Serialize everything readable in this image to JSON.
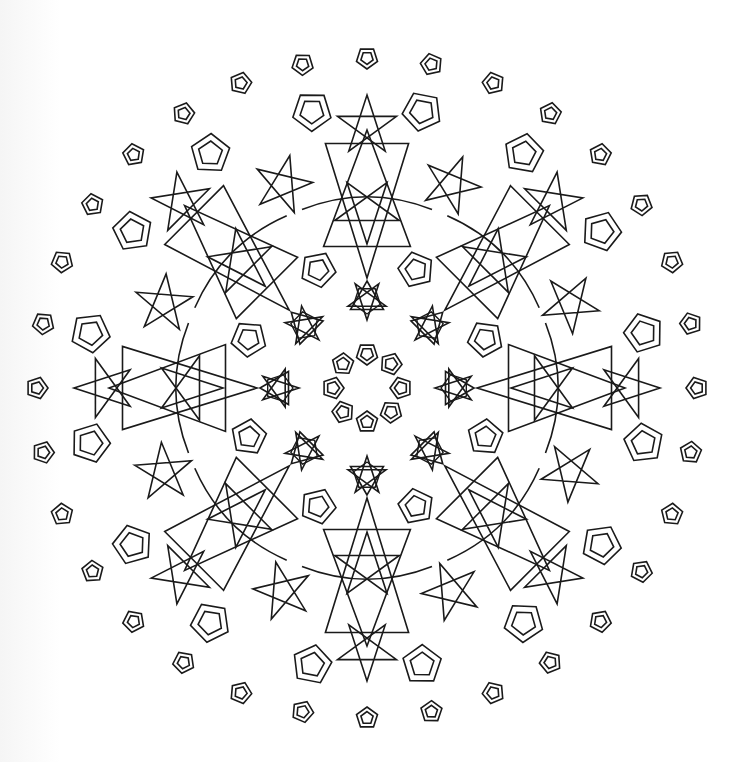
{
  "page": {
    "kind": "mandala-coloring-page",
    "background": "#ffffff",
    "line_color": "#1a1a1a"
  },
  "mandala": {
    "center": [
      367,
      388
    ],
    "symmetry": 8,
    "rings": [
      {
        "name": "inner-pentagon-ring",
        "shape": "double-pentagon",
        "count": 8,
        "radius": 34,
        "size": 11,
        "inner_ratio": 0.6,
        "angle_offset": 0
      },
      {
        "name": "inner-star-cluster-ring",
        "shape": "star-triangle-cluster",
        "count": 8,
        "radius": 88,
        "size": 20,
        "angle_offset": 0
      },
      {
        "name": "inner-big-pentagon-ring",
        "shape": "double-pentagon",
        "count": 8,
        "radius": 128,
        "size": 18,
        "inner_ratio": 0.6,
        "angle_offset": 22.5
      },
      {
        "name": "bowtie-unit-ring",
        "shape": "bowtie-with-star",
        "count": 8,
        "radius_inner": 110,
        "radius_outer": 258,
        "width": 88,
        "star_radius": 178,
        "star_size": 34,
        "angle_offset": 0
      },
      {
        "name": "mid-star-ring",
        "shape": "pentagram",
        "count": 8,
        "radius": 220,
        "size": 30,
        "angle_offset": 22.5
      },
      {
        "name": "outer-star-ring",
        "shape": "pentagram",
        "count": 8,
        "radius": 262,
        "size": 31,
        "angle_offset": 0
      },
      {
        "name": "outer-big-pentagon-ring",
        "shape": "double-pentagon",
        "count": 16,
        "radius": 282,
        "size": 20,
        "inner_ratio": 0.62,
        "angle_offset": 11.25
      },
      {
        "name": "outer-small-pentagon-ring",
        "shape": "double-pentagon",
        "count": 32,
        "radius": 330,
        "size": 11,
        "inner_ratio": 0.58,
        "angle_offset": 0
      }
    ],
    "arcs": {
      "count": 8,
      "radius": 190,
      "note": "curved connecting lines between bowtie units"
    }
  }
}
